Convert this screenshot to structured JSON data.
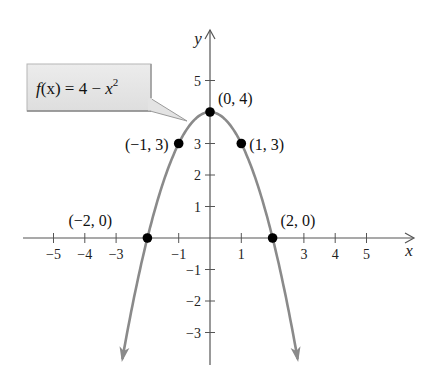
{
  "chart_data": {
    "type": "line",
    "title": "",
    "function_label": "f(x) = 4 − x²",
    "function_label_parts": {
      "lhs": "f",
      "arg": "(x)",
      "rhs": " = 4 − ",
      "var": "x",
      "exp": "2"
    },
    "xlabel": "x",
    "ylabel": "y",
    "xlim": [
      -5.5,
      6
    ],
    "ylim": [
      -4,
      6
    ],
    "grid": false,
    "x_ticks": [
      -5,
      -4,
      -3,
      -2,
      -1,
      1,
      2,
      3,
      4,
      5
    ],
    "x_tick_labels": [
      {
        "value": -5,
        "label": "−5"
      },
      {
        "value": -4,
        "label": "−4"
      },
      {
        "value": -3,
        "label": "−3"
      },
      {
        "value": -1,
        "label": "−1"
      },
      {
        "value": 1,
        "label": "1"
      },
      {
        "value": 3,
        "label": "3"
      },
      {
        "value": 4,
        "label": "4"
      },
      {
        "value": 5,
        "label": "5"
      }
    ],
    "y_ticks": [
      -3,
      -2,
      -1,
      1,
      2,
      3,
      5
    ],
    "y_tick_labels": [
      {
        "value": 5,
        "label": "5"
      },
      {
        "value": 3,
        "label": "3"
      },
      {
        "value": 2,
        "label": "2"
      },
      {
        "value": 1,
        "label": "1"
      },
      {
        "value": -1,
        "label": "−1"
      },
      {
        "value": -2,
        "label": "−2"
      },
      {
        "value": -3,
        "label": "−3"
      }
    ],
    "series": [
      {
        "name": "f(x) = 4 - x^2",
        "expression": "4 - x^2",
        "x_range": [
          -2.8,
          2.8
        ],
        "color": "#8a8a8a"
      }
    ],
    "points": [
      {
        "x": -2,
        "y": 0,
        "label": "(−2, 0)"
      },
      {
        "x": -1,
        "y": 3,
        "label": "(−1, 3)"
      },
      {
        "x": 0,
        "y": 4,
        "label": "(0, 4)"
      },
      {
        "x": 1,
        "y": 3,
        "label": "(1, 3)"
      },
      {
        "x": 2,
        "y": 0,
        "label": "(2, 0)"
      }
    ],
    "colors": {
      "curve": "#8a8a8a",
      "axis": "#555555",
      "point": "#000000",
      "callout_fill": "#e3e3e3",
      "callout_border": "#9a9a9a"
    }
  }
}
